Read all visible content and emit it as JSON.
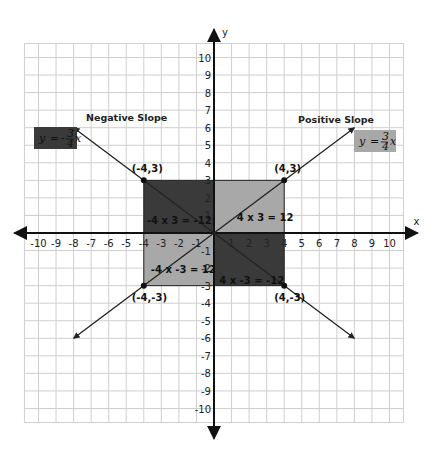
{
  "chart_data": {
    "type": "line",
    "title": "",
    "xlabel": "x",
    "ylabel": "y",
    "xlim": [
      -10,
      10
    ],
    "ylim": [
      -10,
      10
    ],
    "grid": true,
    "x_ticks": [
      "-10",
      "-9",
      "-8",
      "-7",
      "-6",
      "-5",
      "-4",
      "-3",
      "-2",
      "-1",
      "1",
      "2",
      "3",
      "4",
      "5",
      "6",
      "7",
      "8",
      "9",
      "10"
    ],
    "y_ticks": [
      "10",
      "9",
      "8",
      "7",
      "6",
      "5",
      "4",
      "3",
      "2",
      "1",
      "-1",
      "-2",
      "-3",
      "-4",
      "-5",
      "-6",
      "-7",
      "-8",
      "-9",
      "-10"
    ],
    "series": [
      {
        "name": "Positive Slope",
        "equation": "y = 3/4 x",
        "slope": 0.75,
        "x": [
          -8,
          8
        ],
        "y": [
          -6,
          6
        ]
      },
      {
        "name": "Negative Slope",
        "equation": "y = -3/4 x",
        "slope": -0.75,
        "x": [
          -8,
          8
        ],
        "y": [
          6,
          -6
        ]
      }
    ],
    "points": [
      {
        "label": "(-4,3)",
        "x": -4,
        "y": 3
      },
      {
        "label": "(4,3)",
        "x": 4,
        "y": 3
      },
      {
        "label": "(-4,-3)",
        "x": -4,
        "y": -3
      },
      {
        "label": "(4,-3)",
        "x": 4,
        "y": -3
      }
    ],
    "regions": [
      {
        "quadrant": "II",
        "label": "-4 x 3 = -12",
        "color": "#3a3a3a"
      },
      {
        "quadrant": "I",
        "label": "4 x 3 = 12",
        "color": "#a8a8a8"
      },
      {
        "quadrant": "III",
        "label": "-4 x -3 = 12",
        "color": "#a8a8a8"
      },
      {
        "quadrant": "IV",
        "label": "4 x -3 = -12",
        "color": "#3a3a3a"
      }
    ],
    "annotations": {
      "negative_slope_label": "Negative Slope",
      "positive_slope_label": "Positive Slope",
      "negative_eq": {
        "lhs": "y",
        "op": "=",
        "sign": "-",
        "num": "3",
        "den": "4",
        "var": "x",
        "box_color": "#3a3a3a"
      },
      "positive_eq": {
        "lhs": "y",
        "op": "=",
        "sign": "",
        "num": "3",
        "den": "4",
        "var": "x",
        "box_color": "#a8a8a8"
      }
    }
  }
}
